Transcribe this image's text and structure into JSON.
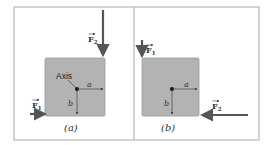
{
  "panels": [
    {
      "caption": "(a)",
      "axis_label": "Axis",
      "dim_a": "a",
      "dim_b": "b",
      "forces": [
        {
          "name": "F",
          "sub": "1",
          "direction": "right"
        },
        {
          "name": "F",
          "sub": "2",
          "direction": "down"
        }
      ]
    },
    {
      "caption": "(b)",
      "dim_a": "a",
      "dim_b": "b",
      "forces": [
        {
          "name": "F",
          "sub": "1",
          "direction": "down"
        },
        {
          "name": "F",
          "sub": "2",
          "direction": "left"
        }
      ]
    }
  ],
  "colors": {
    "block": "#b3b3b3",
    "block_edge": "#8f8f8f",
    "arrow": "#555555",
    "frame": "#aaaaaa"
  }
}
